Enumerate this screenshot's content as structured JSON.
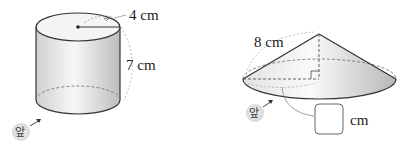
{
  "figures": [
    {
      "shape": "cylinder",
      "labels": {
        "radius": "4 cm",
        "height": "7 cm",
        "front": "앞"
      }
    },
    {
      "shape": "cone",
      "labels": {
        "slant": "8 cm",
        "unit": "cm",
        "front": "앞",
        "answer_box": ""
      }
    }
  ],
  "colors": {
    "stroke": "#333333",
    "fill_light": "#f2f2f2",
    "fill_dark": "#c8c8c8",
    "dashed": "#999999",
    "badge": "#e6e6e6"
  }
}
